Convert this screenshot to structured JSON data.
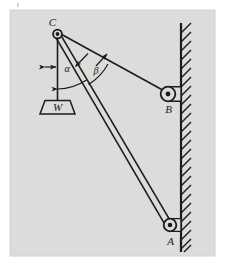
{
  "figure": {
    "canvas": {
      "width": 229,
      "height": 265,
      "background": "#ffffff"
    },
    "panel": {
      "fill": "#dcdcda",
      "x": 10,
      "y": 10,
      "width": 205,
      "height": 246
    },
    "stroke_color": "#1c1c1c",
    "labels": {
      "point_c": "C",
      "point_b": "B",
      "point_a": "A",
      "weight": "W",
      "angle_alpha": "α",
      "angle_beta": "β"
    },
    "nodes": [
      {
        "name": "pivot-c",
        "label": "C",
        "cx": 57.5,
        "cy": 34.0,
        "r": 4.2,
        "kind": "pulley"
      },
      {
        "name": "pulley-b",
        "label": "B",
        "cx": 168.0,
        "cy": 94.0,
        "r": 7.2,
        "kind": "pulley"
      },
      {
        "name": "pulley-a",
        "label": "A",
        "cx": 170.0,
        "cy": 225.0,
        "r": 6.2,
        "kind": "pulley"
      }
    ],
    "wall": {
      "x": 181.0,
      "y_top": 23.0,
      "y_bottom": 252.0,
      "hatch_length": 11.0,
      "hatch_spacing": 9.5,
      "hatch_count": 25
    },
    "members": [
      {
        "name": "boom-ca",
        "from": "C",
        "to": "A",
        "style": "double-line",
        "width": 4.0
      },
      {
        "name": "cable-cb",
        "from": "C",
        "to": "B",
        "style": "single-line"
      },
      {
        "name": "rope-c-weight",
        "from": "C",
        "to": "W",
        "style": "single-line"
      }
    ],
    "weight_block": {
      "name": "weight-block",
      "label": "W",
      "shape": "trapezoid",
      "top_left_x": 45.0,
      "top_right_x": 70.0,
      "bottom_left_x": 40.0,
      "bottom_right_x": 75.0,
      "top_y": 100.0,
      "bottom_y": 114.0
    },
    "angles": [
      {
        "name": "angle-alpha",
        "symbol": "α",
        "label_x": 64.0,
        "label_y": 71.0,
        "between": [
          "rope-c-weight",
          "boom-ca"
        ],
        "has_leader_arrow": true
      },
      {
        "name": "angle-beta",
        "symbol": "β",
        "label_x": 96.0,
        "label_y": 73.0,
        "between": [
          "boom-ca",
          "cable-cb"
        ],
        "has_leader_arrow": true
      }
    ]
  }
}
